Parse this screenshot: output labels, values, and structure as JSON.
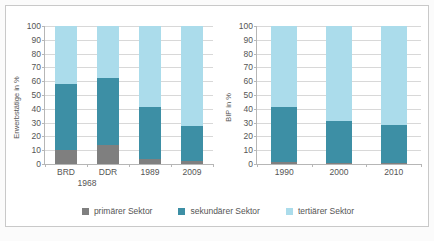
{
  "colors": {
    "primaer": "#7f7f7f",
    "sekundaer": "#3d8fa5",
    "tertiaer": "#abdceb",
    "axis": "#b6b6b6",
    "grid": "#d8d8d8",
    "text": "#555555",
    "frame": "#c9c9c9"
  },
  "legend": {
    "items": [
      {
        "label": "primärer Sektor",
        "color_key": "primaer"
      },
      {
        "label": "sekundärer Sektor",
        "color_key": "sekundaer"
      },
      {
        "label": "tertiärer Sektor",
        "color_key": "tertiaer"
      }
    ]
  },
  "chart_data": [
    {
      "id": "erwerbstaetige",
      "type": "bar",
      "stacked": true,
      "title": "",
      "xlabel": "",
      "ylabel": "Erwerbstätige in %",
      "ylim": [
        0,
        100
      ],
      "yticks": [
        0,
        10,
        20,
        30,
        40,
        50,
        60,
        70,
        80,
        90,
        100
      ],
      "ytick_labels": [
        "0",
        "10",
        "20",
        "30",
        "40",
        "50",
        "60",
        "70",
        "80",
        "90",
        "100"
      ],
      "grid": true,
      "legend_position": "bottom",
      "categories": [
        "BRD",
        "DDR",
        "1989",
        "2009"
      ],
      "group_labels": [
        {
          "text": "1968",
          "spans": [
            "BRD",
            "DDR"
          ]
        }
      ],
      "series": [
        {
          "name": "primärer Sektor",
          "color_key": "primaer",
          "values": [
            10.5,
            13.5,
            3.5,
            2.0
          ]
        },
        {
          "name": "sekundärer Sektor",
          "color_key": "sekundaer",
          "values": [
            47.5,
            49.0,
            37.5,
            25.5
          ]
        },
        {
          "name": "tertiärer Sektor",
          "color_key": "tertiaer",
          "values": [
            42.0,
            37.5,
            59.0,
            72.5
          ]
        }
      ],
      "cumulative_tops": [
        {
          "category": "BRD",
          "primaer": 10.5,
          "sekundaer": 58.0,
          "tertiaer": 100
        },
        {
          "category": "DDR",
          "primaer": 13.5,
          "sekundaer": 62.5,
          "tertiaer": 100
        },
        {
          "category": "1989",
          "primaer": 3.5,
          "sekundaer": 41.0,
          "tertiaer": 100
        },
        {
          "category": "2009",
          "primaer": 2.0,
          "sekundaer": 27.5,
          "tertiaer": 100
        }
      ]
    },
    {
      "id": "bip",
      "type": "bar",
      "stacked": true,
      "title": "",
      "xlabel": "",
      "ylabel": "BIP in %",
      "ylim": [
        0,
        100
      ],
      "yticks": [
        0,
        10,
        20,
        30,
        40,
        50,
        60,
        70,
        80,
        90,
        100
      ],
      "ytick_labels": [
        "0",
        "10",
        "20",
        "30",
        "40",
        "50",
        "60",
        "70",
        "80",
        "90",
        "100"
      ],
      "grid": true,
      "legend_position": "bottom",
      "categories": [
        "1990",
        "2000",
        "2010"
      ],
      "group_labels": [],
      "series": [
        {
          "name": "primärer Sektor",
          "color_key": "primaer",
          "values": [
            1.5,
            1.0,
            0.9
          ]
        },
        {
          "name": "sekundärer Sektor",
          "color_key": "sekundaer",
          "values": [
            39.5,
            30.0,
            27.6
          ]
        },
        {
          "name": "tertiärer Sektor",
          "color_key": "tertiaer",
          "values": [
            59.0,
            69.0,
            71.5
          ]
        }
      ],
      "cumulative_tops": [
        {
          "category": "1990",
          "primaer": 1.5,
          "sekundaer": 41.0,
          "tertiaer": 100
        },
        {
          "category": "2000",
          "primaer": 1.0,
          "sekundaer": 31.0,
          "tertiaer": 100
        },
        {
          "category": "2010",
          "primaer": 0.9,
          "sekundaer": 28.5,
          "tertiaer": 100
        }
      ]
    }
  ]
}
